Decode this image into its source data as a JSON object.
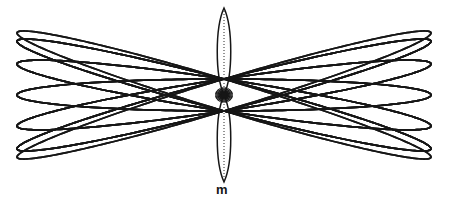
{
  "figure": {
    "kind": "geometric-line-diagram",
    "title_text": "",
    "background_color": "#ffffff",
    "stroke_color": "#161616",
    "axis_stroke_color": "#2b2b2b",
    "canvas": {
      "width": 450,
      "height": 204
    },
    "labels": {
      "node_point": "m"
    },
    "chart_data": {
      "type": "line",
      "title": "",
      "xlabel": "",
      "ylabel": "",
      "grid": false,
      "legend": false,
      "description": "Family of congruent ellipses (great circles of a torus seen obliquely) inclined at alternating angles, all intersecting at a common node m on the vertical axis; outline forms a barrel-shaped lattice with two narrow vertical lens curves on the central meridian.",
      "geometry": {
        "center": {
          "x": 224,
          "y": 95
        },
        "bounding_box": {
          "x": 16,
          "y": 7,
          "width": 414,
          "height": 168
        },
        "ring_count": 12,
        "ring_rx": 207,
        "ring_ry": 16,
        "node_radius": 3,
        "meridian_lens": {
          "half_width": 9,
          "top_y": 8,
          "bottom_y": 182
        },
        "axis_line": {
          "x": 224,
          "y1": 8,
          "y2": 182,
          "dash": "1,2"
        },
        "tilt_angles_deg": [
          0,
          15,
          30,
          45,
          60,
          75,
          90,
          105,
          120,
          135,
          150,
          165
        ]
      },
      "series": [
        {
          "name": "ellipse-01",
          "tilt_deg": 0,
          "rx": 207,
          "ry": 16
        },
        {
          "name": "ellipse-02",
          "tilt_deg": 15,
          "rx": 207,
          "ry": 16
        },
        {
          "name": "ellipse-03",
          "tilt_deg": 30,
          "rx": 207,
          "ry": 16
        },
        {
          "name": "ellipse-04",
          "tilt_deg": 45,
          "rx": 207,
          "ry": 16
        },
        {
          "name": "ellipse-05",
          "tilt_deg": 60,
          "rx": 207,
          "ry": 16
        },
        {
          "name": "ellipse-06",
          "tilt_deg": 75,
          "rx": 207,
          "ry": 16
        },
        {
          "name": "ellipse-07",
          "tilt_deg": 90,
          "rx": 207,
          "ry": 16
        },
        {
          "name": "ellipse-08",
          "tilt_deg": 105,
          "rx": 207,
          "ry": 16
        },
        {
          "name": "ellipse-09",
          "tilt_deg": 120,
          "rx": 207,
          "ry": 16
        },
        {
          "name": "ellipse-10",
          "tilt_deg": 135,
          "rx": 207,
          "ry": 16
        },
        {
          "name": "ellipse-11",
          "tilt_deg": 150,
          "rx": 207,
          "ry": 16
        },
        {
          "name": "ellipse-12",
          "tilt_deg": 165,
          "rx": 207,
          "ry": 16
        }
      ]
    }
  }
}
